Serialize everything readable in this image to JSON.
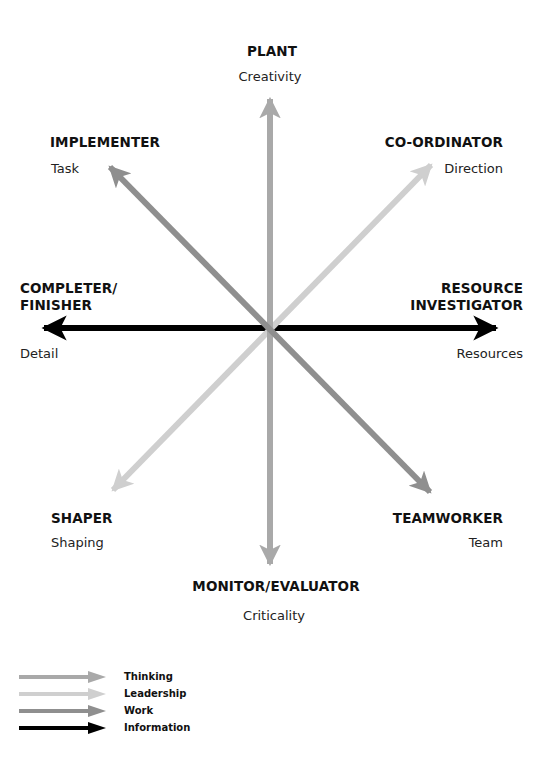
{
  "roles": {
    "plant": {
      "name": "PLANT",
      "trait": "Creativity"
    },
    "implementer": {
      "name": "IMPLEMENTER",
      "trait": "Task"
    },
    "coordinator": {
      "name": "CO-ORDINATOR",
      "trait": "Direction"
    },
    "completer_finisher": {
      "name_line1": "COMPLETER/",
      "name_line2": "FINISHER",
      "trait": "Detail"
    },
    "resource_investigator": {
      "name_line1": "RESOURCE",
      "name_line2": "INVESTIGATOR",
      "trait": "Resources"
    },
    "shaper": {
      "name": "SHAPER",
      "trait": "Shaping"
    },
    "teamworker": {
      "name": "TEAMWORKER",
      "trait": "Team"
    },
    "monitor_evaluator": {
      "name": "MONITOR/EVALUATOR",
      "trait": "Criticality"
    }
  },
  "arrows": [
    {
      "category": "Thinking",
      "color": "#a9a9a9",
      "connects": [
        "PLANT",
        "MONITOR/EVALUATOR"
      ]
    },
    {
      "category": "Leadership",
      "color": "#cfcfcf",
      "connects": [
        "CO-ORDINATOR",
        "SHAPER"
      ]
    },
    {
      "category": "Work",
      "color": "#8f8f8f",
      "connects": [
        "IMPLEMENTER",
        "TEAMWORKER"
      ]
    },
    {
      "category": "Information",
      "color": "#000000",
      "connects": [
        "COMPLETER/FINISHER",
        "RESOURCE INVESTIGATOR"
      ]
    }
  ],
  "legend": {
    "items": [
      {
        "label": "Thinking",
        "color": "#a9a9a9"
      },
      {
        "label": "Leadership",
        "color": "#cfcfcf"
      },
      {
        "label": "Work",
        "color": "#8f8f8f"
      },
      {
        "label": "Information",
        "color": "#000000"
      }
    ]
  }
}
